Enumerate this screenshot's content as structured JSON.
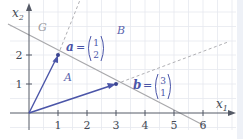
{
  "diagram": {
    "axes": {
      "x_label": "x",
      "x_sub": "1",
      "y_label": "x",
      "y_sub": "2",
      "x_ticks": [
        "1",
        "2",
        "3",
        "4",
        "5",
        "6"
      ],
      "y_ticks": [
        "1",
        "2"
      ]
    },
    "line_label": "G",
    "region_labels": {
      "above": "B",
      "below": "A"
    },
    "vector_a": {
      "name": "a",
      "eq": "=",
      "top": "1",
      "bottom": "2"
    },
    "vector_b": {
      "name": "b",
      "eq": "=",
      "top": "3",
      "bottom": "1"
    },
    "colors": {
      "axis": "#555a66",
      "grid": "#e6e9ef",
      "line_G": "#a8a8ab",
      "vector": "#4a55a8",
      "dashed": "#b0b0b4",
      "label": "#4a55a8",
      "region_label": "#5a64ad",
      "G_label": "#9a9aa0"
    }
  }
}
